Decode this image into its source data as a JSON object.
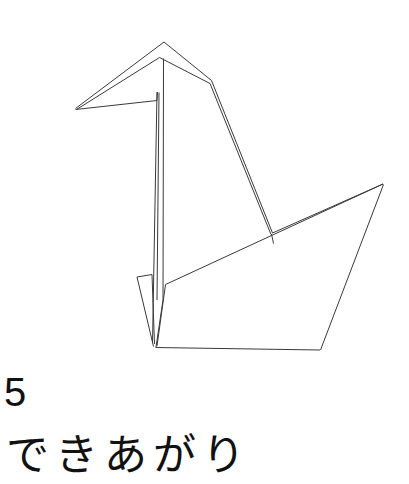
{
  "page": {
    "background_color": "#ffffff",
    "width": 409,
    "height": 484
  },
  "figure": {
    "name": "origami-crane-line-drawing",
    "stroke_color": "#3a3a3a",
    "stroke_width": 1,
    "fill": "none",
    "parts": {
      "head_beak": "beak-and-head-outline",
      "neck": "neck-double-fold-lines",
      "body": "body-panel-outline",
      "wing": "wing-tail-triangle",
      "left_flap": "lower-left-flap"
    }
  },
  "caption": {
    "step_number": "5",
    "text": "できあがり",
    "romaji_meaning": "dekiagari"
  }
}
